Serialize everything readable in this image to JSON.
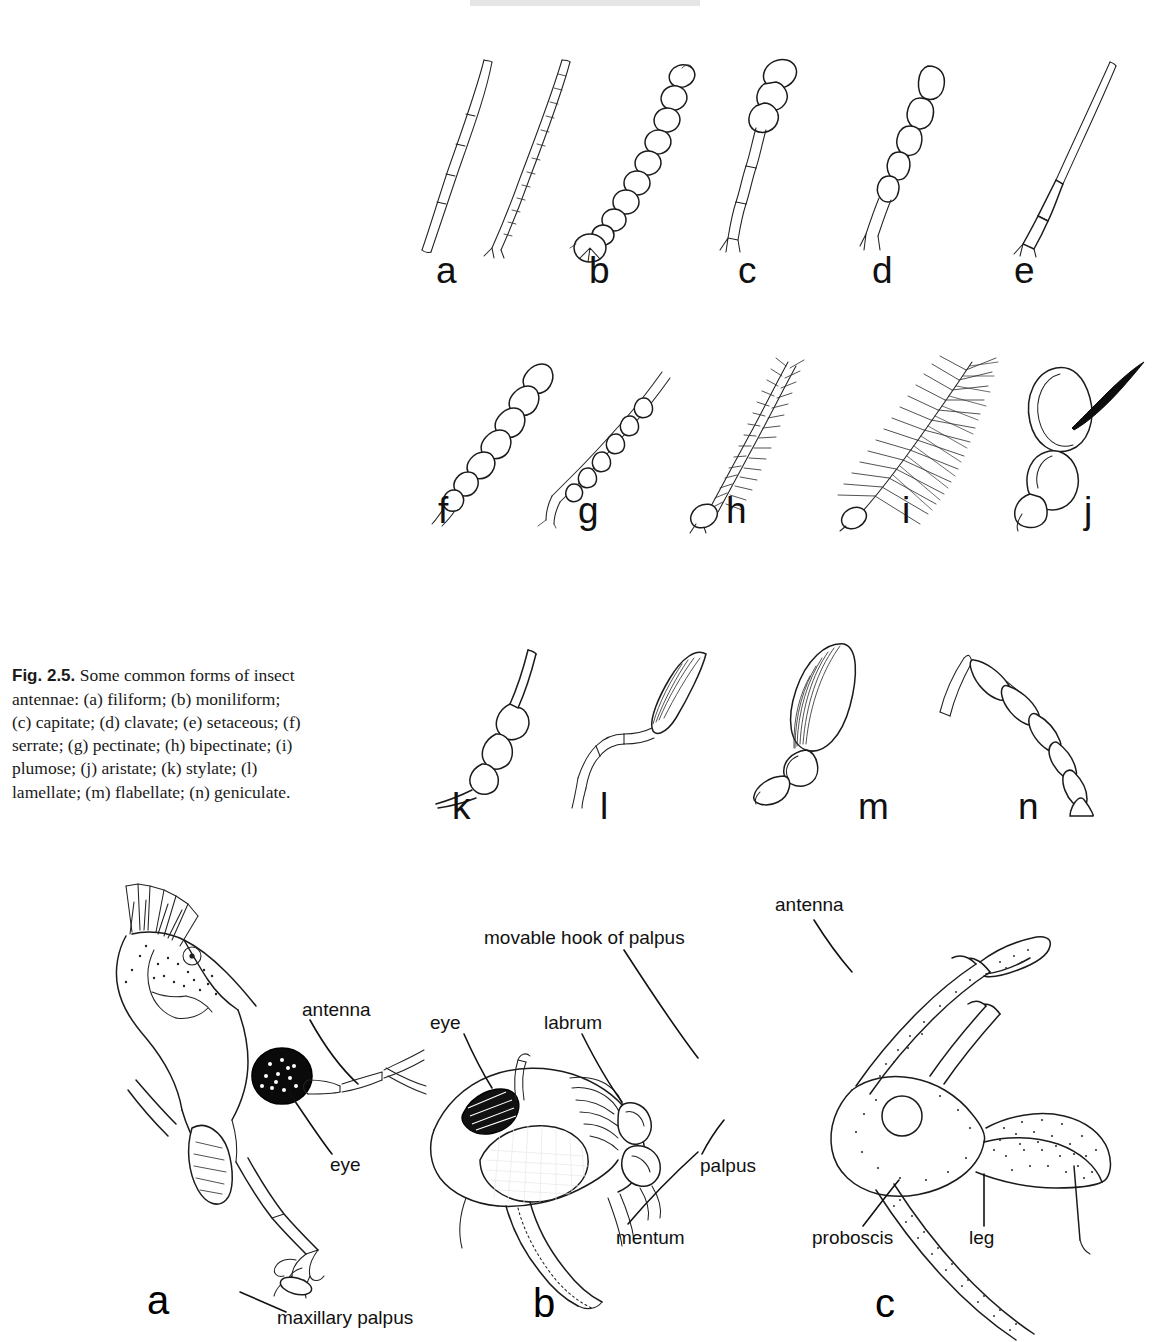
{
  "figure": {
    "number": "Fig. 2.5.",
    "caption_text": "Some common forms of insect antennae: (a) filiform; (b) moniliform; (c) capitate; (d) clavate; (e) setaceous; (f) serrate; (g) pectinate; (h) bipectinate; (i) plumose; (j) aristate; (k) stylate; (l) lamellate; (m) flabellate; (n) geniculate.",
    "caption_full": "Fig. 2.5. Some common forms of insect antennae: (a) filiform; (b) moniliform; (c) capitate; (d) clavate; (e) setaceous; (f) serrate; (g) pectinate; (h) bipectinate; (i) plumose; (j) aristate; (k) stylate; (l) lamellate; (m) flabellate; (n) geniculate."
  },
  "antennae": [
    {
      "letter": "a",
      "name": "filiform",
      "row": 1
    },
    {
      "letter": "b",
      "name": "moniliform",
      "row": 1
    },
    {
      "letter": "c",
      "name": "capitate",
      "row": 1
    },
    {
      "letter": "d",
      "name": "clavate",
      "row": 1
    },
    {
      "letter": "e",
      "name": "setaceous",
      "row": 1
    },
    {
      "letter": "f",
      "name": "serrate",
      "row": 2
    },
    {
      "letter": "g",
      "name": "pectinate",
      "row": 2
    },
    {
      "letter": "h",
      "name": "bipectinate",
      "row": 2
    },
    {
      "letter": "i",
      "name": "plumose",
      "row": 2
    },
    {
      "letter": "j",
      "name": "aristate",
      "row": 2
    },
    {
      "letter": "k",
      "name": "stylate",
      "row": 3
    },
    {
      "letter": "l",
      "name": "lamellate",
      "row": 3
    },
    {
      "letter": "m",
      "name": "flabellate",
      "row": 3
    },
    {
      "letter": "n",
      "name": "geniculate",
      "row": 3
    }
  ],
  "heads": {
    "a": {
      "letter": "a",
      "labels": {
        "antenna": "antenna",
        "eye": "eye",
        "maxillary_palpus": "maxillary palpus"
      }
    },
    "b": {
      "letter": "b",
      "labels": {
        "movable_hook": "movable hook of palpus",
        "eye": "eye",
        "labrum": "labrum",
        "palpus": "palpus",
        "mentum": "mentum"
      }
    },
    "c": {
      "letter": "c",
      "labels": {
        "antenna": "antenna",
        "proboscis": "proboscis",
        "leg": "leg"
      }
    }
  },
  "colors": {
    "ink": "#1b1b1b",
    "page": "#ffffff",
    "text": "#111111"
  }
}
